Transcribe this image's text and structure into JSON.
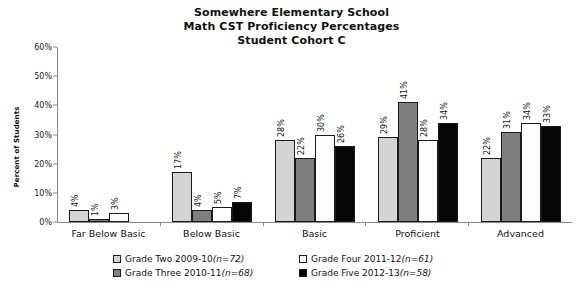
{
  "chart_data": {
    "type": "bar",
    "title": "Somewhere Elementary School Math CST Proficiency Percentages Student Cohort C",
    "title_lines": [
      "Somewhere Elementary School",
      "Math CST Proficiency Percentages",
      "Student Cohort C"
    ],
    "xlabel": "",
    "ylabel": "Percent of Students",
    "ylim": [
      0,
      60
    ],
    "ytick_labels": [
      "0%",
      "10%",
      "20%",
      "30%",
      "40%",
      "50%",
      "60%"
    ],
    "ytick_values": [
      0,
      10,
      20,
      30,
      40,
      50,
      60
    ],
    "grid": false,
    "legend_position": "bottom",
    "categories": [
      "Far Below Basic",
      "Below Basic",
      "Basic",
      "Proficient",
      "Advanced"
    ],
    "series": [
      {
        "name": "Grade Two 2009-10 (n=72)",
        "label_text": "Grade Two 2009-10 ",
        "n_text": "(n=72)",
        "color": "#d4d4d4",
        "values": [
          4,
          17,
          28,
          29,
          22
        ],
        "value_labels": [
          "4%",
          "17%",
          "28%",
          "29%",
          "22%"
        ]
      },
      {
        "name": "Grade Three 2010-11 (n=68)",
        "label_text": "Grade Three 2010-11 ",
        "n_text": "(n=68)",
        "color": "#7f7f7f",
        "values": [
          1,
          4,
          22,
          41,
          31
        ],
        "value_labels": [
          "1%",
          "4%",
          "22%",
          "41%",
          "31%"
        ]
      },
      {
        "name": "Grade Four 2011-12 (n=61)",
        "label_text": "Grade Four 2011-12 ",
        "n_text": "(n=61)",
        "color": "#fdfdfd",
        "values": [
          3,
          5,
          30,
          28,
          34
        ],
        "value_labels": [
          "3%",
          "5%",
          "30%",
          "28%",
          "34%"
        ]
      },
      {
        "name": "Grade Five 2012-13 (n=58)",
        "label_text": "Grade Five 2012-13 ",
        "n_text": "(n=58)",
        "color": "#050505",
        "values": [
          0,
          7,
          26,
          34,
          33
        ],
        "value_labels": [
          "",
          "7%",
          "26%",
          "34%",
          "33%"
        ]
      }
    ]
  }
}
